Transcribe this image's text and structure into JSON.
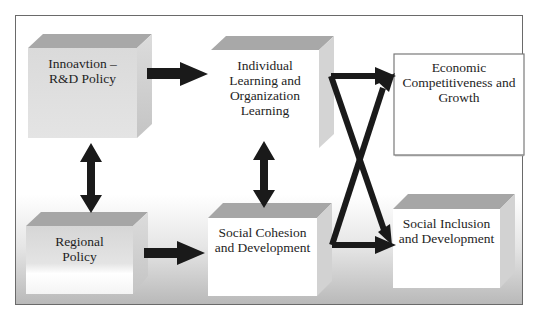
{
  "diagram": {
    "nodes": [
      {
        "id": "innovation",
        "label_lines": [
          "Innoavtion –",
          "R&D Policy"
        ]
      },
      {
        "id": "learning",
        "label_lines": [
          "Individual",
          "Learning and",
          "Organization",
          "Learning"
        ]
      },
      {
        "id": "economic",
        "label_lines": [
          "Economic",
          "Competitiveness and",
          "Growth"
        ]
      },
      {
        "id": "regional",
        "label_lines": [
          "Regional",
          "Policy"
        ]
      },
      {
        "id": "cohesion",
        "label_lines": [
          "Social Cohesion",
          "and Development"
        ]
      },
      {
        "id": "inclusion",
        "label_lines": [
          "Social Inclusion",
          "and Development"
        ]
      }
    ],
    "edges": [
      {
        "from": "innovation",
        "to": "learning",
        "type": "arrow"
      },
      {
        "from": "regional",
        "to": "cohesion",
        "type": "arrow"
      },
      {
        "from": "innovation",
        "to": "regional",
        "type": "double-arrow"
      },
      {
        "from": "learning",
        "to": "cohesion",
        "type": "double-arrow"
      },
      {
        "from": "learning",
        "to": "economic",
        "type": "arrow"
      },
      {
        "from": "learning",
        "to": "inclusion",
        "type": "arrow"
      },
      {
        "from": "cohesion",
        "to": "economic",
        "type": "arrow"
      },
      {
        "from": "cohesion",
        "to": "inclusion",
        "type": "arrow"
      }
    ],
    "colors": {
      "arrow": "#1a1a1a",
      "box_top": "#a6a6a6",
      "box_side": "#d0d0d0",
      "frame": "#6a6a6a"
    }
  }
}
